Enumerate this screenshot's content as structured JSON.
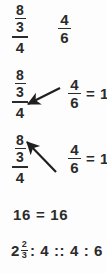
{
  "figure": {
    "kind": "math-worked-example",
    "background_color": "#fdfdfd",
    "ink_color": "#2b2b2b"
  },
  "rows": [
    {
      "id": "plain",
      "left_term": {
        "type": "complex-fraction",
        "numerator_num": "8",
        "numerator_den": "3",
        "denominator": "4"
      },
      "right_term": {
        "type": "fraction",
        "numerator": "4",
        "denominator": "6"
      },
      "arrow": null,
      "result": ""
    },
    {
      "id": "arrow-down",
      "left_term": {
        "type": "complex-fraction",
        "numerator_num": "8",
        "numerator_den": "3",
        "denominator": "4"
      },
      "right_term": {
        "type": "fraction",
        "numerator": "4",
        "denominator": "6"
      },
      "arrow": {
        "name": "cross-multiply-arrow-down-left",
        "direction": "down-left",
        "from": "numerator-4-of-right",
        "to": "denominator-4-of-left"
      },
      "result": "= 16"
    },
    {
      "id": "arrow-up",
      "left_term": {
        "type": "complex-fraction",
        "numerator_num": "8",
        "numerator_den": "3",
        "denominator": "4"
      },
      "right_term": {
        "type": "fraction",
        "numerator": "4",
        "denominator": "6"
      },
      "arrow": {
        "name": "cross-multiply-arrow-up-left",
        "direction": "up-left",
        "from": "denominator-6-of-right",
        "to": "numerator-8-of-left"
      },
      "result": "= 16"
    }
  ],
  "equality_line": {
    "left": "16",
    "operator": "=",
    "right": "16",
    "full": "16 = 16"
  },
  "proportion_line": {
    "mixed_number": {
      "whole": "2",
      "numerator": "2",
      "denominator": "3"
    },
    "ratio_tail": ": 4 :: 4 : 6",
    "full": "2 2/3 : 4 :: 4 : 6"
  }
}
